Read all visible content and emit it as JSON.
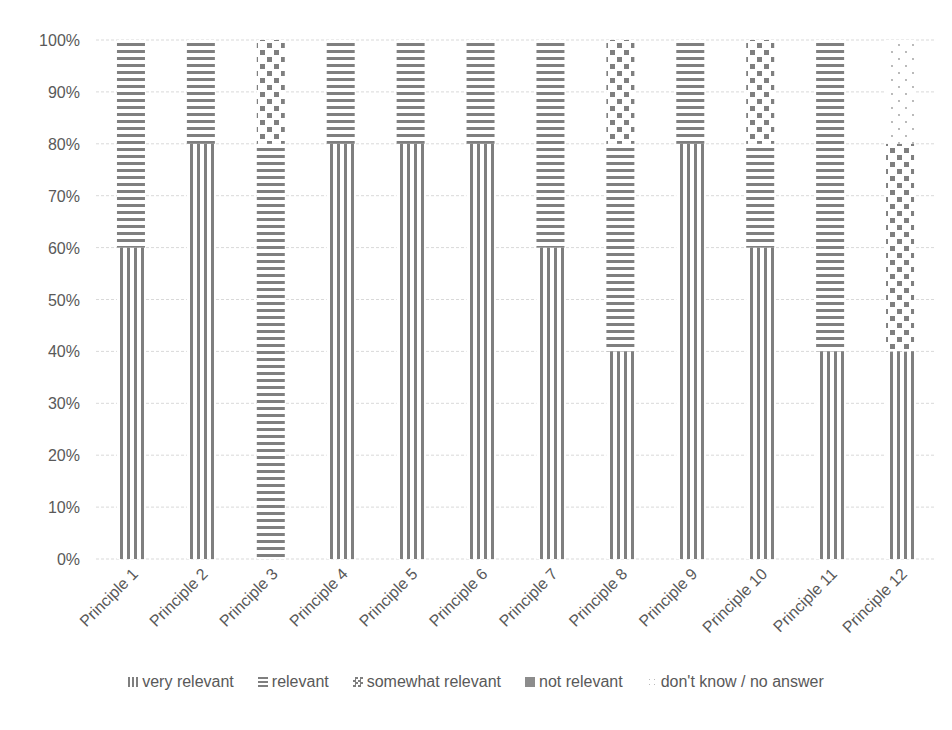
{
  "chart_data": {
    "type": "bar",
    "stacked": true,
    "percent": true,
    "title": "",
    "xlabel": "",
    "ylabel": "",
    "ylim": [
      0,
      100
    ],
    "yticks": [
      "0%",
      "10%",
      "20%",
      "30%",
      "40%",
      "50%",
      "60%",
      "70%",
      "80%",
      "90%",
      "100%"
    ],
    "grid": true,
    "legend_position": "bottom",
    "categories": [
      "Principle 1",
      "Principle 2",
      "Principle 3",
      "Principle 4",
      "Principle 5",
      "Principle 6",
      "Principle 7",
      "Principle 8",
      "Principle 9",
      "Principle 10",
      "Principle 11",
      "Principle 12"
    ],
    "series": [
      {
        "name": "very relevant",
        "pattern": "vertical",
        "values": [
          60,
          80,
          0,
          80,
          80,
          80,
          60,
          40,
          80,
          60,
          40,
          40
        ]
      },
      {
        "name": "relevant",
        "pattern": "horizontal",
        "values": [
          40,
          20,
          80,
          20,
          20,
          20,
          40,
          40,
          20,
          20,
          60,
          0
        ]
      },
      {
        "name": "somewhat relevant",
        "pattern": "checker",
        "values": [
          0,
          0,
          20,
          0,
          0,
          0,
          0,
          20,
          0,
          20,
          0,
          40
        ]
      },
      {
        "name": "not relevant",
        "pattern": "solid-check",
        "values": [
          0,
          0,
          0,
          0,
          0,
          0,
          0,
          0,
          0,
          0,
          0,
          0
        ]
      },
      {
        "name": "don't know / no answer",
        "pattern": "dots",
        "values": [
          0,
          0,
          0,
          0,
          0,
          0,
          0,
          0,
          0,
          0,
          0,
          20
        ]
      }
    ]
  },
  "legend": {
    "items": [
      "very relevant",
      "relevant",
      "somewhat relevant",
      "not relevant",
      "don't know / no answer"
    ]
  },
  "colors": {
    "pattern": "#7f7f7f",
    "grid": "#d9d9d9",
    "text": "#595959"
  }
}
